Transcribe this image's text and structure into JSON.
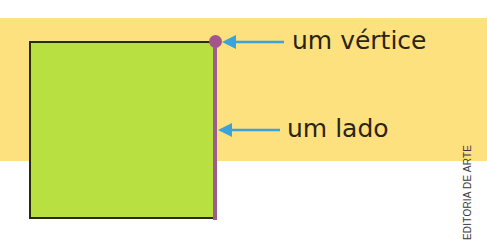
{
  "diagram": {
    "shape": "square",
    "colors": {
      "background_band": "#fde17e",
      "square_fill": "#b7e040",
      "square_border": "#2a2a10",
      "highlighted_side": "#9b5f8e",
      "vertex_dot": "#a3568c",
      "arrows": "#3aa3dc",
      "label_text": "#2a2412"
    },
    "annotations": [
      {
        "label": "um vértice",
        "target": "vertex",
        "arrow_direction": "left"
      },
      {
        "label": "um lado",
        "target": "side",
        "arrow_direction": "left"
      }
    ]
  },
  "credit": "EDITORIA DE ARTE"
}
